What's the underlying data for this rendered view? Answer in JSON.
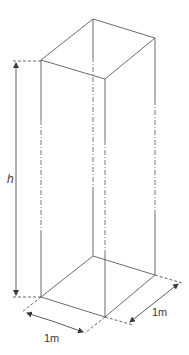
{
  "diagram": {
    "labels": {
      "height": "h",
      "base_width": "1m",
      "base_depth": "1m"
    },
    "line_styles": {
      "edges": "solid",
      "mid_section": "dash-dot (broken view)",
      "extension_lines": "dashed"
    }
  }
}
